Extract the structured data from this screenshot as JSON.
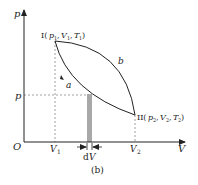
{
  "figure": {
    "caption": "(b)",
    "axes": {
      "x_label": "V",
      "y_label": "p",
      "origin_label": "O"
    },
    "points": {
      "state1": {
        "prefix": "I(",
        "p": "p",
        "p_sub": "1",
        "v": "V",
        "v_sub": "1",
        "t": "T",
        "t_sub": "1",
        "suffix": ")"
      },
      "state2": {
        "prefix": "II(",
        "p": "p",
        "p_sub": "2",
        "v": "V",
        "v_sub": "2",
        "t": "T",
        "t_sub": "2",
        "suffix": ")"
      }
    },
    "curves": {
      "upper": "b",
      "lower": "a"
    },
    "ticks": {
      "p_level": "p",
      "v1": "V",
      "v1_sub": "1",
      "v2": "V",
      "v2_sub": "2"
    },
    "element": {
      "dV_d": "d",
      "dV_V": "V"
    },
    "colors": {
      "line": "#222222",
      "dashed": "#888888",
      "shade": "#a8a8a8"
    }
  }
}
